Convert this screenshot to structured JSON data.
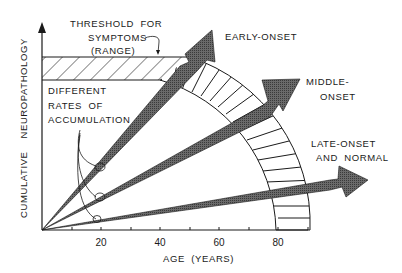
{
  "diagram": {
    "y_axis_label": "CUMULATIVE    NEUROPATHOLOGY",
    "x_axis_label": "AGE  (YEARS)",
    "x_ticks": [
      "20",
      "40",
      "60",
      "80"
    ],
    "threshold_label": [
      "THRESHOLD  FOR",
      "SYMPTOMS",
      "(RANGE)"
    ],
    "rates_label": [
      "DIFFERENT",
      "RATES  OF",
      "ACCUMULATION"
    ],
    "arrows": [
      {
        "label": [
          "EARLY-ONSET"
        ]
      },
      {
        "label": [
          "MIDDLE-",
          "ONSET"
        ]
      },
      {
        "label": [
          "LATE-ONSET",
          "AND  NORMAL"
        ]
      }
    ],
    "colors": {
      "ink": "#1a1a1a",
      "arrow_fill": "#555555",
      "background": "#ffffff"
    }
  }
}
